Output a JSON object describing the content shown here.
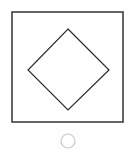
{
  "figure": {
    "outer_square": {
      "x": 12,
      "y": 12,
      "width": 111,
      "height": 110,
      "stroke": "#333333",
      "stroke_width": 1.5
    },
    "diamond": {
      "points": "68,29 109,70 68,110 28,70",
      "stroke": "#2a2a2a",
      "stroke_width": 1.2
    },
    "radio_circle": {
      "cx": 68,
      "cy": 141,
      "r": 7,
      "stroke": "#c8c8c8",
      "stroke_width": 1.2
    }
  }
}
